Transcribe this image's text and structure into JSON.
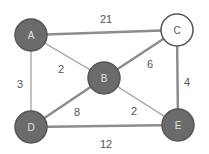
{
  "graph": {
    "nodes": [
      {
        "id": "A",
        "label": "A",
        "x": 31,
        "y": 35,
        "fill": "#6b6b6b",
        "text": "#e0e0e0"
      },
      {
        "id": "C",
        "label": "C",
        "x": 177,
        "y": 30,
        "fill": "#ffffff",
        "text": "#555555"
      },
      {
        "id": "B",
        "label": "B",
        "x": 104,
        "y": 78,
        "fill": "#6b6b6b",
        "text": "#e0e0e0"
      },
      {
        "id": "D",
        "label": "D",
        "x": 31,
        "y": 127,
        "fill": "#6b6b6b",
        "text": "#e0e0e0"
      },
      {
        "id": "E",
        "label": "E",
        "x": 178,
        "y": 125,
        "fill": "#6b6b6b",
        "text": "#e0e0e0"
      }
    ],
    "edges": [
      {
        "from": "A",
        "to": "C",
        "weight": "21",
        "lx": 106,
        "ly": 20,
        "bold": true
      },
      {
        "from": "A",
        "to": "B",
        "weight": "2",
        "lx": 61,
        "ly": 70,
        "bold": false
      },
      {
        "from": "A",
        "to": "D",
        "weight": "3",
        "lx": 20,
        "ly": 85,
        "bold": false
      },
      {
        "from": "B",
        "to": "C",
        "weight": "6",
        "lx": 150,
        "ly": 65,
        "bold": true
      },
      {
        "from": "C",
        "to": "E",
        "weight": "4",
        "lx": 187,
        "ly": 83,
        "bold": true
      },
      {
        "from": "B",
        "to": "D",
        "weight": "8",
        "lx": 77,
        "ly": 113,
        "bold": true
      },
      {
        "from": "B",
        "to": "E",
        "weight": "2",
        "lx": 134,
        "ly": 112,
        "bold": false
      },
      {
        "from": "D",
        "to": "E",
        "weight": "12",
        "lx": 106,
        "ly": 145,
        "bold": true
      }
    ]
  },
  "colors": {
    "edge": "#9a9a9a",
    "edge_bold": "#8c8c8c",
    "node_stroke": "#555555"
  }
}
